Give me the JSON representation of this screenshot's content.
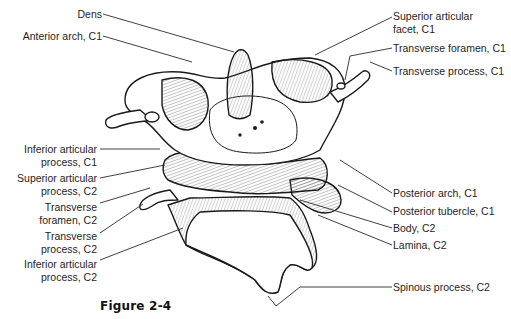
{
  "figure": {
    "caption": "Figure 2-4"
  },
  "labels_left": [
    {
      "text": "Dens"
    },
    {
      "text": "Anterior arch, C1"
    },
    {
      "line1": "Inferior articular",
      "line2": "process, C1"
    },
    {
      "line1": "Superior articular",
      "line2": "process, C2"
    },
    {
      "line1": "Transverse",
      "line2": "foramen, C2"
    },
    {
      "line1": "Transverse",
      "line2": "process, C2"
    },
    {
      "line1": "Inferior articular",
      "line2": "process, C2"
    }
  ],
  "labels_right": [
    {
      "line1": "Superior articular",
      "line2": "facet, C1"
    },
    {
      "text": "Transverse foramen, C1"
    },
    {
      "text": "Transverse process, C1"
    },
    {
      "text": "Posterior arch, C1"
    },
    {
      "text": "Posterior tubercle, C1"
    },
    {
      "text": "Body, C2"
    },
    {
      "text": "Lamina, C2"
    },
    {
      "text": "Spinous process, C2"
    }
  ]
}
